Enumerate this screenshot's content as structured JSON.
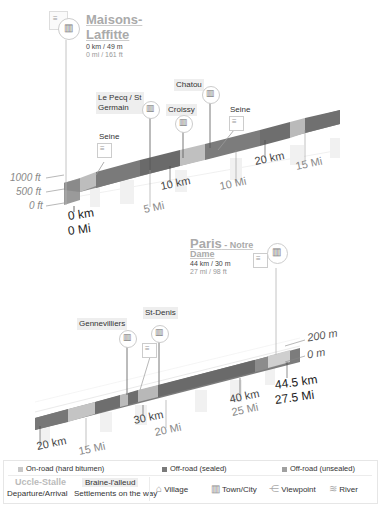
{
  "profile1": {
    "start": {
      "name_line1": "Maisons-",
      "name_line2": "Laffitte",
      "distance": "0 km / 49 m",
      "distance_imperial": "0 mi / 161 ft"
    },
    "places": [
      {
        "name": "Seine",
        "type": "river"
      },
      {
        "name_line1": "Le Pecq / St",
        "name_line2": "Germain",
        "type": "town"
      },
      {
        "name": "Croissy",
        "type": "town"
      },
      {
        "name": "Chatou",
        "type": "town"
      },
      {
        "name": "Seine",
        "type": "river"
      }
    ],
    "y_axis": [
      "1000 ft",
      "500 ft",
      "0 ft"
    ],
    "km_ticks": [
      "0 km",
      "10 km",
      "20 km"
    ],
    "mi_ticks": [
      "0 Mi",
      "5 Mi",
      "10 Mi",
      "15 Mi"
    ]
  },
  "profile2": {
    "end": {
      "name_bold": "Paris",
      "name_rest": " - Notre",
      "name_line2": "Dame",
      "distance": "44 km / 30 m",
      "distance_imperial": "27 mi / 98 ft"
    },
    "places": [
      {
        "name": "Gennevilliers",
        "type": "town"
      },
      {
        "name": "St-Denis",
        "type": "town"
      }
    ],
    "y_axis": [
      "200 m",
      "0 m"
    ],
    "km_ticks": [
      "20 km",
      "30 km",
      "40 km",
      "44.5 km"
    ],
    "mi_ticks": [
      "15 Mi",
      "20 Mi",
      "25 Mi",
      "27.5 Mi"
    ]
  },
  "legend": {
    "surfaces": [
      {
        "label": "On-road (hard bitumen)",
        "color": "#c8c8c8"
      },
      {
        "label": "Off-road (sealed)",
        "color": "#7a7a7a"
      },
      {
        "label": "Off-road (unsealed)",
        "color": "#a0a0a0"
      }
    ],
    "departure_example": "Uccle-Stalle",
    "settlement_example": "Braine-l'alleud",
    "departure_label": "Departure/Arrival",
    "settlement_label": "Settlements on the way",
    "icons": [
      {
        "label": "Village",
        "icon": "village-icon"
      },
      {
        "label": "Town/City",
        "icon": "town-icon"
      },
      {
        "label": "Viewpoint",
        "icon": "viewpoint-icon"
      },
      {
        "label": "River",
        "icon": "river-icon"
      }
    ]
  },
  "colors": {
    "road_dark": "#6e6e6e",
    "road_mid": "#8a8a8a",
    "road_light": "#c4c4c4",
    "shadow": "#eeeeee"
  }
}
